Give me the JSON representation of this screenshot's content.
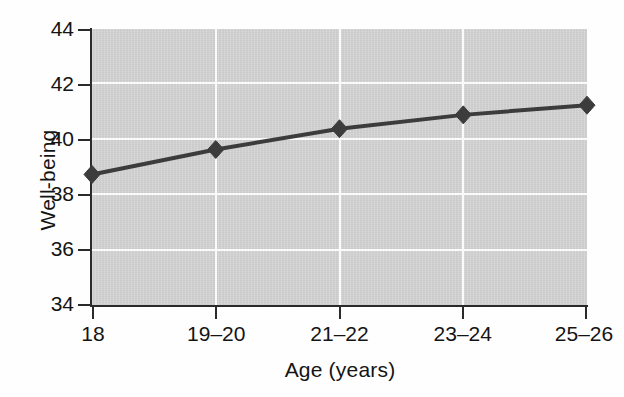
{
  "chart_data": {
    "type": "line",
    "title": "",
    "subtitle": "",
    "xlabel": "Age (years)",
    "ylabel": "Well-being",
    "categories": [
      "18",
      "19–20",
      "21–22",
      "23–24",
      "25–26"
    ],
    "values": [
      38.75,
      39.65,
      40.4,
      40.9,
      41.25
    ],
    "series": [
      {
        "name": "Well-being",
        "values": [
          38.75,
          39.65,
          40.4,
          40.9,
          41.25
        ]
      }
    ],
    "ylim": [
      34,
      44
    ],
    "yticks": [
      "34",
      "36",
      "38",
      "40",
      "42",
      "44"
    ],
    "ytick_values": [
      34,
      36,
      38,
      40,
      42,
      44
    ],
    "xticks": [
      "18",
      "19–20",
      "21–22",
      "23–24",
      "25–26"
    ],
    "grid": "both",
    "grid_color": "#fafafa",
    "plot_background": "#d2d2d2",
    "figure_background": "#ffffff",
    "line_color": "#3c3c3c",
    "marker": "diamond",
    "marker_color": "#3c3c3c",
    "legend": "none",
    "legend_position": "none",
    "annotations": []
  },
  "axes": {
    "y_title": "Well-being",
    "x_title": "Age (years)"
  }
}
